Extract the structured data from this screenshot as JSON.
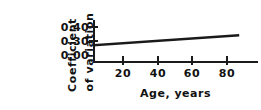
{
  "figure": {
    "background_color": "#ffffff",
    "ink_color": "#1a1a1a"
  },
  "chart_data": {
    "type": "line",
    "title": "",
    "subtitle": "",
    "xlabel": "Age, years",
    "ylabel": "Coefficient of variation",
    "ylabel_line_1": "Coefficient",
    "ylabel_line_2": "of variation",
    "x": [
      0,
      90
    ],
    "values": [
      0.27,
      0.34
    ],
    "series": [
      {
        "name": "Coefficient of variation",
        "x": [
          0,
          90
        ],
        "values": [
          0.27,
          0.34
        ],
        "color": "#1a1a1a",
        "line_width": 2.4
      }
    ],
    "xlim": [
      0,
      95
    ],
    "ylim": [
      0.0,
      0.45
    ],
    "y_axis_broken": true,
    "y_axis_note": "Baseline drawn at 0.00; scale resumes at 0.30",
    "xticks": [
      20,
      40,
      60,
      80
    ],
    "xtick_labels": [
      "20",
      "40",
      "60",
      "80"
    ],
    "yticks": [
      0.0,
      0.3,
      0.4
    ],
    "ytick_labels": [
      "0.40",
      "0.30",
      "0.00"
    ],
    "grid": false,
    "legend": false,
    "legend_position": "none"
  },
  "axes": {
    "y_tick_rows": [
      {
        "label": "0.40",
        "top_px": 22
      },
      {
        "label": "0.30",
        "top_px": 36
      },
      {
        "label": "0.00",
        "top_px": 50
      }
    ],
    "y_tick_marks": [
      {
        "top_px": 27
      },
      {
        "top_px": 41
      }
    ],
    "x_tick_marks": [
      {
        "left_px": 122,
        "label": "20"
      },
      {
        "left_px": 157,
        "label": "40"
      },
      {
        "left_px": 191,
        "label": "60"
      },
      {
        "left_px": 226,
        "label": "80"
      }
    ]
  }
}
